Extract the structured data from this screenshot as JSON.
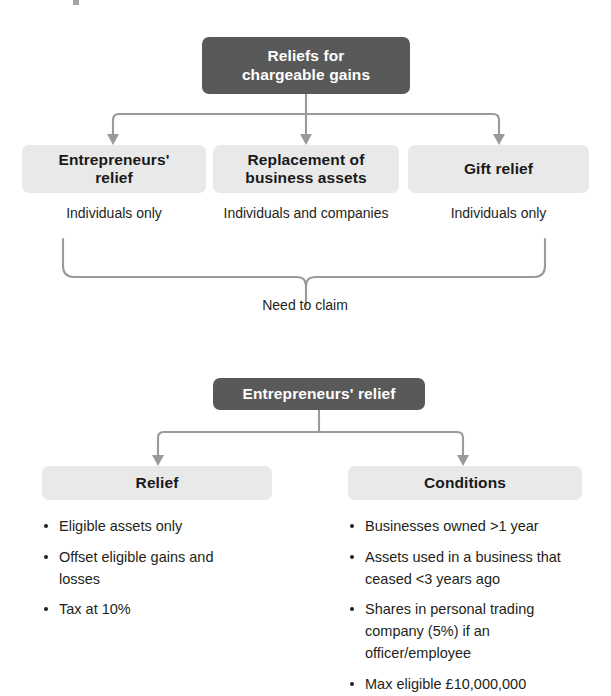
{
  "diagram": {
    "title_fragment": "",
    "colors": {
      "dark_node": "#595959",
      "light_node": "#e9e9e9",
      "connector": "#9a9a9a",
      "text": "#231f20",
      "dark_node_text": "#ffffff"
    },
    "section_one": {
      "root": {
        "label_line_1": "Reliefs for",
        "label_line_2": "chargeable gains"
      },
      "branches": [
        {
          "label_line_1": "Entrepreneurs'",
          "label_line_2": "relief",
          "caption": "Individuals only"
        },
        {
          "label_line_1": "Replacement of",
          "label_line_2": "business assets",
          "caption": "Individuals and companies"
        },
        {
          "label_line_1": "Gift relief",
          "label_line_2": "",
          "caption": "Individuals only"
        }
      ],
      "merge_label": "Need to claim"
    },
    "section_two": {
      "root": {
        "label": "Entrepreneurs' relief"
      },
      "columns": [
        {
          "heading": "Relief",
          "items": [
            "Eligible assets only",
            "Offset eligible gains and losses",
            "Tax at 10%"
          ]
        },
        {
          "heading": "Conditions",
          "items": [
            "Businesses owned >1 year",
            "Assets used in a business that ceased <3 years ago",
            "Shares in personal trading company (5%) if an officer/employee",
            "Max eligible £10,000,000"
          ]
        }
      ]
    }
  }
}
